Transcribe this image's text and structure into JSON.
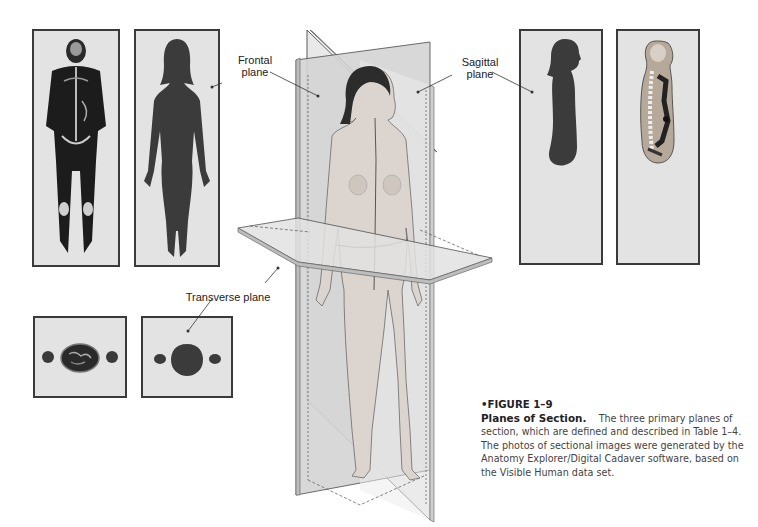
{
  "figure": {
    "labels": {
      "frontal": [
        "Frontal",
        "plane"
      ],
      "sagittal": [
        "Sagittal",
        "plane"
      ],
      "transverse": "Transverse plane"
    },
    "panels": {
      "frontal_scan": "frontal-section-scan",
      "frontal_silhouette": "frontal-section-silhouette",
      "sagittal_silhouette": "sagittal-section-silhouette",
      "sagittal_scan": "sagittal-section-scan",
      "transverse_scan": "transverse-section-scan",
      "transverse_silhouette": "transverse-section-silhouette"
    },
    "colors": {
      "panel_bg": "#e3e3e3",
      "panel_border": "#3a3a3a",
      "silhouette": "#3b3b3b",
      "plane_fill": "#d6d6d6",
      "plane_edge": "#5a5a5a",
      "skin": "#d9d2cc"
    }
  },
  "caption": {
    "figure_number": "•FIGURE 1–9",
    "title": "Planes of Section.",
    "body": "The three primary planes of section, which are defined and described in Table 1–4. The photos of sectional images were generated by the Anatomy Explorer/Digital Cadaver software, based on the Visible Human data set."
  }
}
